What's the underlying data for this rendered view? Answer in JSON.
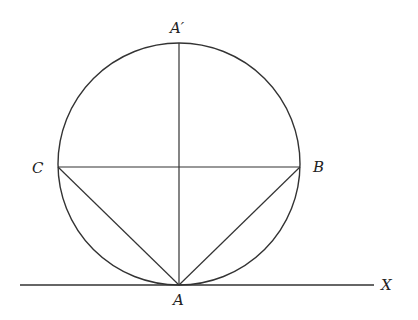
{
  "diagram": {
    "type": "geometry",
    "labels": {
      "A_prime": "A′",
      "C": "C",
      "B": "B",
      "A": "A",
      "X": "X"
    },
    "colors": {
      "stroke": "#333333",
      "text": "#222222",
      "background": "#ffffff"
    },
    "geometry": {
      "circle": {
        "cx": 179,
        "cy": 164,
        "r": 121
      },
      "tangent_line": {
        "x1": 20,
        "y1": 285,
        "x2": 374,
        "y2": 285
      },
      "diameter": {
        "x1": 179,
        "y1": 43,
        "x2": 179,
        "y2": 285
      },
      "chord_CB": {
        "x1": 58,
        "y1": 167,
        "x2": 300,
        "y2": 167
      },
      "chord_AC": {
        "x1": 179,
        "y1": 285,
        "x2": 58,
        "y2": 167
      },
      "chord_AB": {
        "x1": 179,
        "y1": 285,
        "x2": 300,
        "y2": 167
      }
    }
  }
}
